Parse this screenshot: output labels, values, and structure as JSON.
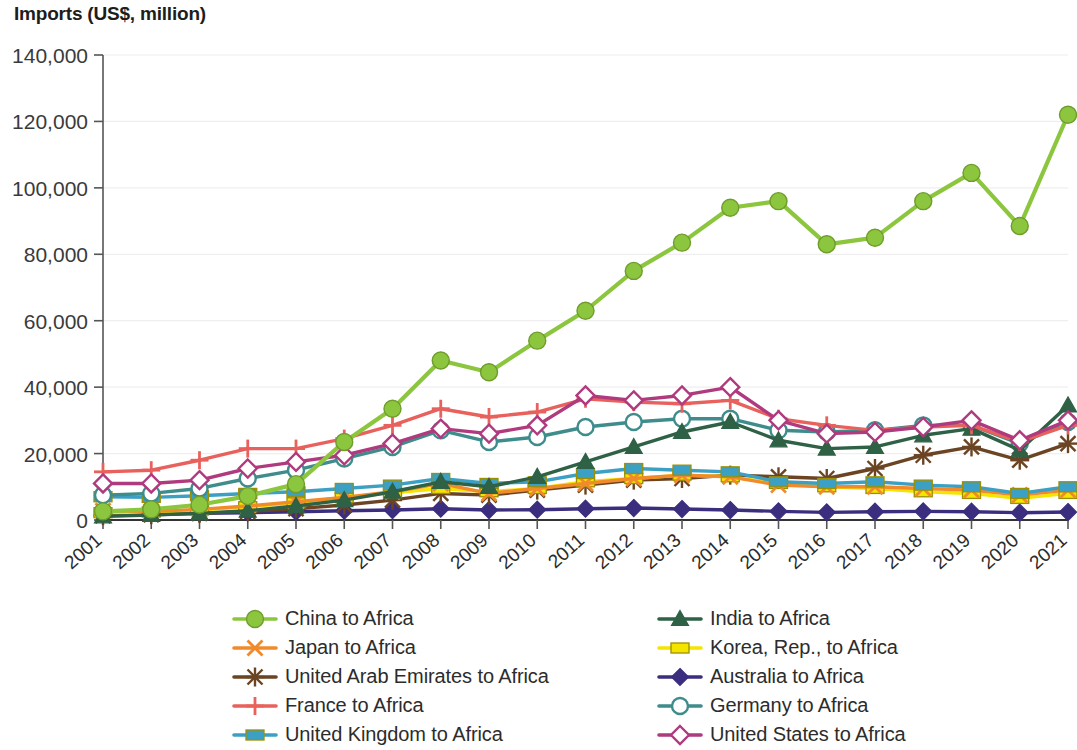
{
  "chart_data": {
    "type": "line",
    "title": "Imports (US$, million)",
    "xlabel": "",
    "ylabel": "",
    "ylim": [
      0,
      140000
    ],
    "ytick_step": 20000,
    "yticks": [
      "0",
      "20,000",
      "40,000",
      "60,000",
      "80,000",
      "100,000",
      "120,000",
      "140,000"
    ],
    "grid": true,
    "legend_position": "bottom",
    "categories": [
      "2001",
      "2002",
      "2003",
      "2004",
      "2005",
      "2006",
      "2007",
      "2008",
      "2009",
      "2010",
      "2011",
      "2012",
      "2013",
      "2014",
      "2015",
      "2016",
      "2017",
      "2018",
      "2019",
      "2020",
      "2021"
    ],
    "series": [
      {
        "name": "China to Africa",
        "color": "#8CC63E",
        "marker": "circle-filled",
        "values": [
          2600,
          3200,
          4600,
          7200,
          10800,
          23500,
          33500,
          48000,
          44500,
          54000,
          63000,
          75000,
          83500,
          94000,
          96000,
          83000,
          85000,
          96000,
          104500,
          88500,
          122000
        ]
      },
      {
        "name": "India to Africa",
        "color": "#2E6145",
        "marker": "triangle-filled",
        "values": [
          1100,
          1500,
          2000,
          2800,
          4200,
          6000,
          8500,
          11500,
          10000,
          13000,
          17500,
          22000,
          26500,
          29500,
          24000,
          21500,
          22000,
          25500,
          27500,
          21000,
          34500
        ]
      },
      {
        "name": "Japan to Africa",
        "color": "#F08A2B",
        "marker": "x",
        "values": [
          2800,
          2600,
          3200,
          4200,
          5500,
          6800,
          8500,
          11000,
          8000,
          9500,
          11000,
          12500,
          13500,
          13000,
          10500,
          10000,
          10000,
          9500,
          9000,
          7500,
          9000
        ]
      },
      {
        "name": "Korea, Rep., to Africa",
        "color": "#F5E400",
        "marker": "square-filled",
        "values": [
          2200,
          2400,
          3000,
          4000,
          5200,
          6800,
          8200,
          9500,
          8500,
          9500,
          11500,
          12500,
          13500,
          13000,
          11000,
          10000,
          9500,
          8500,
          8000,
          6500,
          8000
        ]
      },
      {
        "name": "United Arab Emirates to Africa",
        "color": "#6B4423",
        "marker": "asterisk",
        "values": [
          1300,
          1600,
          2000,
          2600,
          3400,
          4500,
          6000,
          8000,
          7500,
          9000,
          10500,
          12000,
          12500,
          13500,
          13000,
          12500,
          15500,
          19500,
          22000,
          18000,
          23000
        ]
      },
      {
        "name": "Australia to Africa",
        "color": "#3B2E7E",
        "marker": "diamond-filled",
        "values": [
          1900,
          1900,
          2000,
          2200,
          2500,
          2800,
          3000,
          3400,
          3000,
          3100,
          3400,
          3600,
          3300,
          3000,
          2600,
          2300,
          2500,
          2600,
          2500,
          2200,
          2400
        ]
      },
      {
        "name": "France to Africa",
        "color": "#E8615C",
        "marker": "plus",
        "values": [
          14500,
          15000,
          18000,
          21500,
          21500,
          24500,
          28500,
          33500,
          31000,
          32500,
          36500,
          35500,
          35000,
          36000,
          30500,
          28500,
          27000,
          28000,
          28500,
          23500,
          28500
        ]
      },
      {
        "name": "Germany to Africa",
        "color": "#3E8C8C",
        "marker": "circle-open",
        "values": [
          7500,
          8000,
          9500,
          12500,
          15000,
          18500,
          22000,
          27000,
          23500,
          25000,
          28000,
          29500,
          30500,
          30500,
          27000,
          26500,
          27000,
          28500,
          28500,
          23000,
          29500
        ]
      },
      {
        "name": "United Kingdom to Africa",
        "color": "#3CA0C4",
        "marker": "square-filled",
        "values": [
          7000,
          6800,
          7300,
          8000,
          8500,
          9500,
          10500,
          12500,
          11000,
          11500,
          14000,
          15500,
          15000,
          14500,
          11500,
          11000,
          11500,
          10500,
          10000,
          8000,
          10000
        ]
      },
      {
        "name": "United States to Africa",
        "color": "#B03A7E",
        "marker": "diamond-open",
        "values": [
          11000,
          11000,
          12000,
          15500,
          17500,
          19500,
          23000,
          27500,
          26000,
          28500,
          37500,
          36000,
          37500,
          40000,
          30000,
          26000,
          26500,
          28000,
          30000,
          24000,
          30000
        ]
      }
    ]
  },
  "legend": {
    "items": [
      {
        "label": "China to Africa",
        "series": 0
      },
      {
        "label": "India to Africa",
        "series": 1
      },
      {
        "label": "Japan to Africa",
        "series": 2
      },
      {
        "label": "Korea, Rep., to Africa",
        "series": 3
      },
      {
        "label": "United Arab Emirates to Africa",
        "series": 4
      },
      {
        "label": "Australia to Africa",
        "series": 5
      },
      {
        "label": "France to Africa",
        "series": 6
      },
      {
        "label": "Germany to Africa",
        "series": 7
      },
      {
        "label": "United Kingdom to Africa",
        "series": 8
      },
      {
        "label": "United States to Africa",
        "series": 9
      }
    ]
  }
}
